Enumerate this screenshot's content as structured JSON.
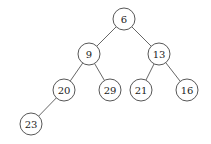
{
  "diagram": {
    "type": "binary-tree",
    "node_radius": 11,
    "colors": {
      "stroke": "#444444",
      "fill": "#ffffff",
      "text": "#222222",
      "edge": "#555555"
    },
    "nodes": [
      {
        "id": "n6",
        "label": "6",
        "x": 124,
        "y": 19
      },
      {
        "id": "n9",
        "label": "9",
        "x": 89,
        "y": 54
      },
      {
        "id": "n13",
        "label": "13",
        "x": 159,
        "y": 54
      },
      {
        "id": "n20",
        "label": "20",
        "x": 64,
        "y": 90
      },
      {
        "id": "n29",
        "label": "29",
        "x": 110,
        "y": 90
      },
      {
        "id": "n21",
        "label": "21",
        "x": 141,
        "y": 90
      },
      {
        "id": "n16",
        "label": "16",
        "x": 187,
        "y": 90
      },
      {
        "id": "n23",
        "label": "23",
        "x": 31,
        "y": 124
      }
    ],
    "edges": [
      {
        "from": "n6",
        "to": "n9"
      },
      {
        "from": "n6",
        "to": "n13"
      },
      {
        "from": "n9",
        "to": "n20"
      },
      {
        "from": "n9",
        "to": "n29"
      },
      {
        "from": "n13",
        "to": "n21"
      },
      {
        "from": "n13",
        "to": "n16"
      },
      {
        "from": "n20",
        "to": "n23"
      }
    ]
  }
}
